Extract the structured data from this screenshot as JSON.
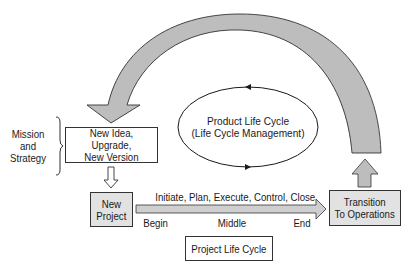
{
  "diagram": {
    "mission_label": "Mission\nand\nStrategy",
    "new_idea_box": "New Idea, Upgrade,\nNew Version",
    "product_life_cycle": "Product Life Cycle\n(Life Cycle Management)",
    "new_project_box": "New\nProject",
    "phases_label": "Initiate, Plan, Execute, Control, Close",
    "begin_label": "Begin",
    "middle_label": "Middle",
    "end_label": "End",
    "transition_box": "Transition\nTo Operations",
    "project_life_cycle_box": "Project Life Cycle",
    "colors": {
      "arrow_fill": "#bdbdbd",
      "box_fill": "#e2e2e2",
      "stroke": "#333333"
    }
  }
}
